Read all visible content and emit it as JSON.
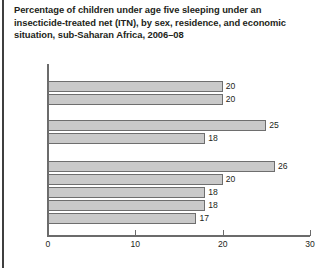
{
  "title": {
    "line1": "Percentage of children under age five sleeping under an",
    "line2": "insecticide-treated net (ITN), by sex, residence, and economic",
    "line3": "situation, sub-Saharan Africa, 2006–08"
  },
  "colors": {
    "bar_fill": "#c9c9c9",
    "bar_border": "#6e6e6e",
    "axis": "#6b6b6b",
    "text": "#231f20",
    "rule": "#3f3f3f"
  },
  "chart_data": {
    "type": "bar",
    "orientation": "horizontal",
    "title": "Percentage of children under age five sleeping under an insecticide-treated net (ITN), by sex, residence, and economic situation, sub-Saharan Africa, 2006–08",
    "xlabel": "",
    "ylabel": "",
    "xlim": [
      0,
      30
    ],
    "ticks": [
      0,
      10,
      20,
      30
    ],
    "tick_labels": [
      "0",
      "10",
      "20",
      "30"
    ],
    "grid": false,
    "legend": false,
    "categories": [
      "Male",
      "Female",
      "Urban",
      "Rural",
      "Richest",
      "Fourth",
      "Middle",
      "Second",
      "Poorest"
    ],
    "values": [
      20,
      20,
      25,
      18,
      26,
      20,
      18,
      18,
      17
    ],
    "value_labels": [
      "20",
      "20",
      "25",
      "18",
      "26",
      "20",
      "18",
      "18",
      "17"
    ],
    "groups": [
      {
        "name": "Sex",
        "categories": [
          "Male",
          "Female"
        ],
        "values": [
          20,
          20
        ]
      },
      {
        "name": "Residence",
        "categories": [
          "Urban",
          "Rural"
        ],
        "values": [
          25,
          18
        ]
      },
      {
        "name": "Economic situation",
        "categories": [
          "Richest",
          "Fourth",
          "Middle",
          "Second",
          "Poorest"
        ],
        "values": [
          26,
          20,
          18,
          18,
          17
        ]
      }
    ],
    "bars": [
      {
        "label": "Male",
        "value": 20,
        "value_label": "20",
        "top": 19,
        "group": "Sex"
      },
      {
        "label": "Female",
        "value": 20,
        "value_label": "20",
        "top": 32,
        "group": "Sex"
      },
      {
        "label": "Urban",
        "value": 25,
        "value_label": "25",
        "top": 58,
        "group": "Residence"
      },
      {
        "label": "Rural",
        "value": 18,
        "value_label": "18",
        "top": 71,
        "group": "Residence"
      },
      {
        "label": "Richest",
        "value": 26,
        "value_label": "26",
        "top": 99,
        "group": "Economic situation"
      },
      {
        "label": "Fourth",
        "value": 20,
        "value_label": "20",
        "top": 112,
        "group": "Economic situation"
      },
      {
        "label": "Middle",
        "value": 18,
        "value_label": "18",
        "top": 125,
        "group": "Economic situation"
      },
      {
        "label": "Second",
        "value": 18,
        "value_label": "18",
        "top": 138,
        "group": "Economic situation"
      },
      {
        "label": "Poorest",
        "value": 17,
        "value_label": "17",
        "top": 151,
        "group": "Economic situation"
      }
    ]
  }
}
